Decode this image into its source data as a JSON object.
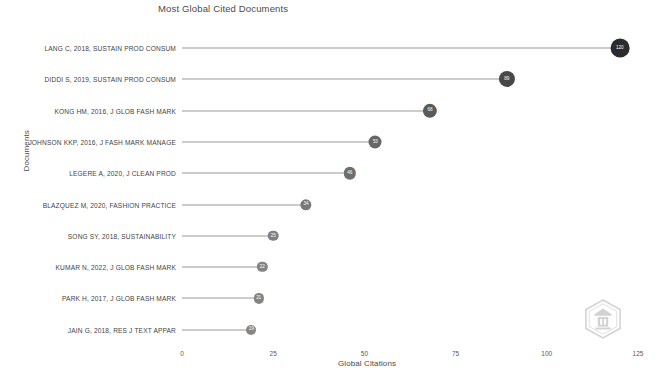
{
  "chart_data": {
    "type": "bar",
    "subtype": "lollipop-horizontal",
    "title": "Most Global Cited Documents",
    "xlabel": "Global Citations",
    "ylabel": "Documents",
    "xlim": [
      0,
      125
    ],
    "xticks": [
      "0",
      "25",
      "50",
      "75",
      "100",
      "125"
    ],
    "grid": false,
    "legend": false,
    "orientation": "horizontal",
    "categories": [
      "LANG C, 2018, SUSTAIN PROD CONSUM",
      "DIDDI S, 2019, SUSTAIN PROD CONSUM",
      "KONG HM, 2016, J GLOB FASH MARK",
      "JOHNSON KKP, 2016, J FASH MARK MANAGE",
      "LEGERE A, 2020, J CLEAN PROD",
      "BLAZQUEZ M, 2020, FASHION PRACTICE",
      "SONG SY, 2018, SUSTAINABILITY",
      "KUMAR N, 2022, J GLOB FASH MARK",
      "PARK H, 2017, J GLOB FASH MARK",
      "JAIN G, 2018, RES J TEXT APPAR"
    ],
    "values": [
      120,
      89,
      68,
      53,
      46,
      34,
      25,
      22,
      21,
      19
    ],
    "point_labels": [
      "120",
      "89",
      "68",
      "53",
      "46",
      "34",
      "25",
      "22",
      "21",
      "19"
    ]
  },
  "watermark": {
    "name": "hexagon-badge-watermark"
  }
}
